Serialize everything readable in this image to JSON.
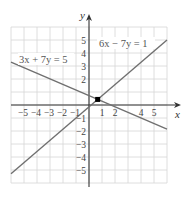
{
  "chart_data": {
    "type": "line",
    "title": "",
    "xlabel": "x",
    "ylabel": "y",
    "xlim": [
      -6,
      6
    ],
    "ylim": [
      -6,
      6
    ],
    "grid": true,
    "x_tick_labels": [
      "−5",
      "−4",
      "−3",
      "−2",
      "−1",
      "1",
      "2",
      "4",
      "5"
    ],
    "x_tick_values": [
      -5,
      -4,
      -3,
      -2,
      -1,
      1,
      2,
      4,
      5
    ],
    "y_tick_labels": [
      "5",
      "4",
      "3",
      "2",
      "−1",
      "−2",
      "−3",
      "−4",
      "−5"
    ],
    "y_tick_values": [
      5,
      4,
      3,
      2,
      -1,
      -2,
      -3,
      -4,
      -5
    ],
    "series": [
      {
        "name": "3x + 7y = 5",
        "equation": "3x + 7y = 5",
        "x": [
          -6,
          6
        ],
        "y": [
          3.29,
          -1.86
        ],
        "color": "#707070"
      },
      {
        "name": "6x − 7y = 1",
        "equation": "6x − 7y = 1",
        "x": [
          -6,
          6
        ],
        "y": [
          -5.29,
          5
        ],
        "color": "#707070"
      }
    ],
    "annotations": [
      {
        "type": "point",
        "label": "intersection",
        "x": 0.667,
        "y": 0.429,
        "color": "#000000"
      },
      {
        "type": "text",
        "text": "3x + 7y = 5",
        "x": -4.2,
        "y": 3.4
      },
      {
        "type": "text",
        "text": "6x − 7y = 1",
        "x": 2.9,
        "y": 4.6
      }
    ]
  },
  "labels": {
    "x_axis": "x",
    "y_axis": "y",
    "eq1": "3x + 7y = 5",
    "eq2": "6x − 7y = 1",
    "xticks": [
      "−5",
      "−4",
      "−3",
      "−2",
      "−1",
      "1",
      "2",
      "4",
      "5"
    ],
    "yticks": [
      "5",
      "4",
      "3",
      "2",
      "−1",
      "−2",
      "−3",
      "−4",
      "−5"
    ]
  },
  "colors": {
    "grid": "#d6d6d6",
    "axis": "#333333",
    "line": "#707070",
    "point": "#000000"
  }
}
